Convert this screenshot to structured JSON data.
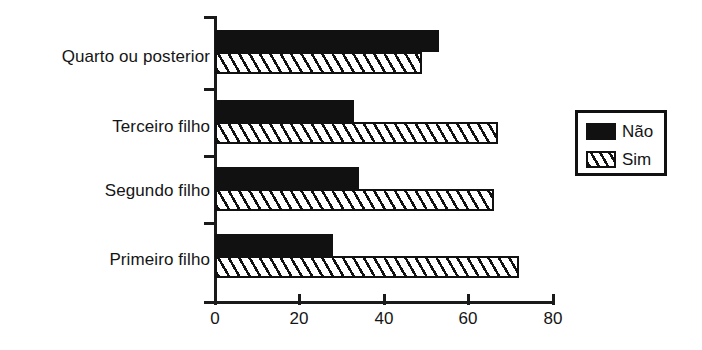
{
  "chart_data": {
    "type": "bar",
    "orientation": "horizontal",
    "title": "",
    "xlabel": "",
    "ylabel": "",
    "xlim": [
      0,
      80
    ],
    "xticks": [
      0,
      20,
      40,
      60,
      80
    ],
    "xtick_labels": [
      "0",
      "20",
      "40",
      "60",
      "80"
    ],
    "grid": false,
    "legend_position": "right",
    "categories": [
      "Quarto ou posterior",
      "Terceiro filho",
      "Segundo filho",
      "Primeiro filho"
    ],
    "series": [
      {
        "name": "Não",
        "fill": "solid-black",
        "values": [
          53,
          33,
          34,
          28
        ]
      },
      {
        "name": "Sim",
        "fill": "diagonal-hatch",
        "values": [
          49,
          67,
          66,
          72
        ]
      }
    ]
  },
  "axis": {
    "ticks": [
      {
        "label": "0",
        "value": 0
      },
      {
        "label": "20",
        "value": 20
      },
      {
        "label": "40",
        "value": 40
      },
      {
        "label": "60",
        "value": 60
      },
      {
        "label": "80",
        "value": 80
      }
    ]
  },
  "legend": {
    "entries": [
      {
        "label": "Não",
        "swatch": "solid-black"
      },
      {
        "label": "Sim",
        "swatch": "diagonal-hatch"
      }
    ]
  },
  "colors": {
    "ink": "#111111",
    "background": "#ffffff"
  }
}
